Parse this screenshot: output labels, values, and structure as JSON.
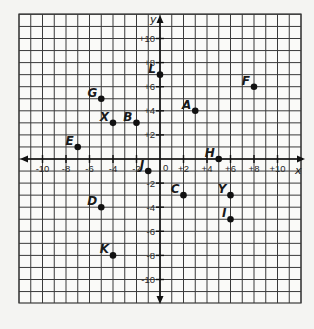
{
  "grid": {
    "x_min": -12,
    "x_max": 12,
    "y_min": -12,
    "y_max": 12,
    "line_color": "#3a3a3a",
    "background": "#fafaf8"
  },
  "axes": {
    "x_label": "x",
    "y_label": "y",
    "origin_label": "0",
    "x_ticks": [
      {
        "value": -10,
        "label": "-10"
      },
      {
        "value": -8,
        "label": "-8"
      },
      {
        "value": -6,
        "label": "-6"
      },
      {
        "value": -4,
        "label": "-4"
      },
      {
        "value": -2,
        "label": "-2"
      },
      {
        "value": 2,
        "label": "+2"
      },
      {
        "value": 4,
        "label": "+4"
      },
      {
        "value": 6,
        "label": "+6"
      },
      {
        "value": 8,
        "label": "+8"
      },
      {
        "value": 10,
        "label": "+10"
      }
    ],
    "y_ticks": [
      {
        "value": 10,
        "label": "+10"
      },
      {
        "value": 8,
        "label": "+8"
      },
      {
        "value": 6,
        "label": "+6"
      },
      {
        "value": 4,
        "label": "+4"
      },
      {
        "value": 2,
        "label": "+2"
      },
      {
        "value": -2,
        "label": "-2"
      },
      {
        "value": -4,
        "label": "-4"
      },
      {
        "value": -6,
        "label": "-6"
      },
      {
        "value": -8,
        "label": "-8"
      },
      {
        "value": -10,
        "label": "-10"
      }
    ]
  },
  "points": [
    {
      "label": "L",
      "x": 0,
      "y": 7
    },
    {
      "label": "G",
      "x": -5,
      "y": 5
    },
    {
      "label": "X",
      "x": -4,
      "y": 3
    },
    {
      "label": "B",
      "x": -2,
      "y": 3
    },
    {
      "label": "E",
      "x": -7,
      "y": 1
    },
    {
      "label": "A",
      "x": 3,
      "y": 4
    },
    {
      "label": "F",
      "x": 8,
      "y": 6
    },
    {
      "label": "H",
      "x": 5,
      "y": 0
    },
    {
      "label": "J",
      "x": -1,
      "y": -1
    },
    {
      "label": "C",
      "x": 2,
      "y": -3
    },
    {
      "label": "Y",
      "x": 6,
      "y": -3
    },
    {
      "label": "I",
      "x": 6,
      "y": -5
    },
    {
      "label": "D",
      "x": -5,
      "y": -4
    },
    {
      "label": "K",
      "x": -4,
      "y": -8
    }
  ]
}
